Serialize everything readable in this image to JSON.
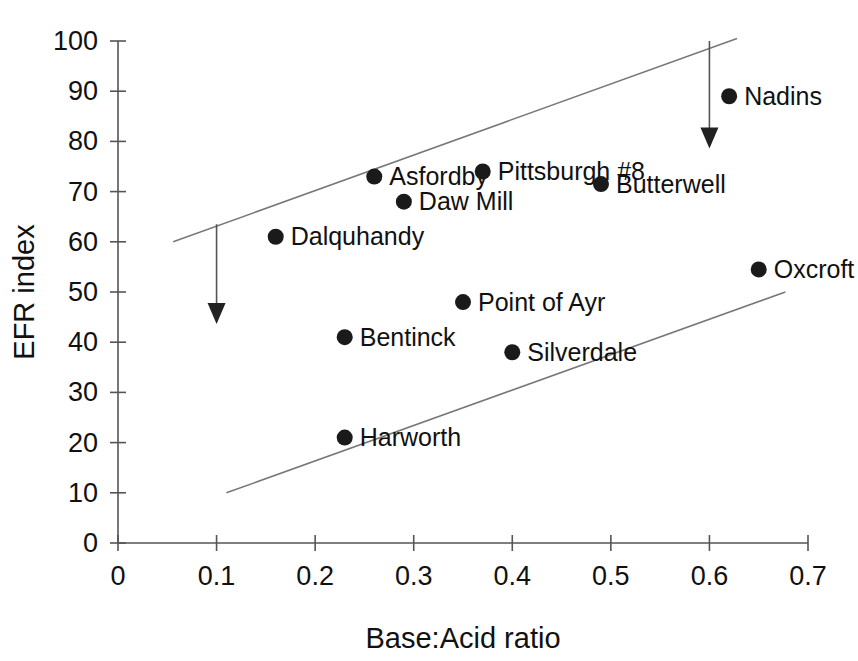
{
  "chart_data": {
    "type": "scatter",
    "title": "",
    "xlabel": "Base:Acid ratio",
    "ylabel": "EFR index",
    "xlim": [
      0,
      0.7
    ],
    "ylim": [
      0,
      100
    ],
    "grid": false,
    "legend": "none",
    "x_ticks": [
      "0",
      "0.1",
      "0.2",
      "0.3",
      "0.4",
      "0.5",
      "0.6",
      "0.7"
    ],
    "x_tick_values": [
      0,
      0.1,
      0.2,
      0.3,
      0.4,
      0.5,
      0.6,
      0.7
    ],
    "y_ticks": [
      "0",
      "10",
      "20",
      "30",
      "40",
      "50",
      "60",
      "70",
      "80",
      "90",
      "100"
    ],
    "y_tick_values": [
      0,
      10,
      20,
      30,
      40,
      50,
      60,
      70,
      80,
      90,
      100
    ],
    "points": [
      {
        "label": "Nadins",
        "x": 0.62,
        "y": 89,
        "label_side": "right"
      },
      {
        "label": "Asfordby",
        "x": 0.26,
        "y": 73,
        "label_side": "right"
      },
      {
        "label": "Pittsburgh #8",
        "x": 0.37,
        "y": 74,
        "label_side": "right"
      },
      {
        "label": "Butterwell",
        "x": 0.49,
        "y": 71.5,
        "label_side": "right"
      },
      {
        "label": "Daw Mill",
        "x": 0.29,
        "y": 68,
        "label_side": "right"
      },
      {
        "label": "Dalquhandy",
        "x": 0.16,
        "y": 61,
        "label_side": "right"
      },
      {
        "label": "Oxcroft",
        "x": 0.65,
        "y": 54.5,
        "label_side": "right"
      },
      {
        "label": "Point of Ayr",
        "x": 0.35,
        "y": 48,
        "label_side": "right"
      },
      {
        "label": "Bentinck",
        "x": 0.23,
        "y": 41,
        "label_side": "right"
      },
      {
        "label": "Silverdale",
        "x": 0.4,
        "y": 38,
        "label_side": "right"
      },
      {
        "label": "Harworth",
        "x": 0.23,
        "y": 21,
        "label_side": "right"
      }
    ],
    "trend_lines": [
      {
        "name": "upper-bound-line",
        "x1": 0.056,
        "y1": 60,
        "x2": 0.628,
        "y2": 100.5
      },
      {
        "name": "lower-bound-line",
        "x1": 0.11,
        "y1": 10,
        "x2": 0.677,
        "y2": 50
      }
    ],
    "annotations": [
      {
        "name": "upper-left-arrow",
        "x": 0.1,
        "y_from": 63.5,
        "y_to": 45
      },
      {
        "name": "upper-right-arrow",
        "x": 0.6,
        "y_from": 100,
        "y_to": 80
      }
    ]
  }
}
